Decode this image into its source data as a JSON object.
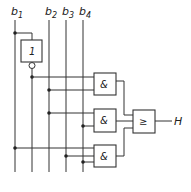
{
  "diagram": {
    "type": "logic-circuit",
    "inputs": [
      {
        "id": "b1",
        "label": "b",
        "sub": "1"
      },
      {
        "id": "b2",
        "label": "b",
        "sub": "2"
      },
      {
        "id": "b3",
        "label": "b",
        "sub": "3"
      },
      {
        "id": "b4",
        "label": "b",
        "sub": "4"
      }
    ],
    "gates": [
      {
        "id": "not1",
        "symbol": "1",
        "type": "NOT",
        "inputs": [
          "b1"
        ]
      },
      {
        "id": "and1",
        "symbol": "&",
        "type": "AND",
        "inputs": [
          "not1",
          "b2"
        ]
      },
      {
        "id": "and2",
        "symbol": "&",
        "type": "AND",
        "inputs": [
          "b2",
          "b4"
        ]
      },
      {
        "id": "and3",
        "symbol": "&",
        "type": "AND",
        "inputs": [
          "b1",
          "b3",
          "b4"
        ]
      },
      {
        "id": "or1",
        "symbol": "≥",
        "type": "OR",
        "inputs": [
          "and1",
          "and2",
          "and3"
        ]
      }
    ],
    "output": {
      "label": "H"
    },
    "colors": {
      "line": "#333333",
      "background": "#ffffff"
    }
  }
}
